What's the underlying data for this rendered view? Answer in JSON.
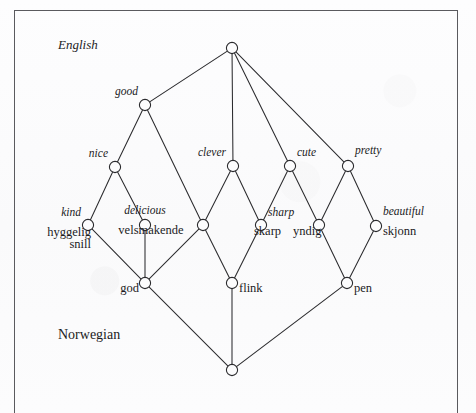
{
  "figure": {
    "type": "concept-lattice-diagram",
    "language_tags": [
      {
        "name": "english-tag",
        "text": "English",
        "style": "italic",
        "x": 58,
        "y": 48
      },
      {
        "name": "norwegian-tag",
        "text": "Norwegian",
        "style": "upright",
        "x": 58,
        "y": 338
      }
    ],
    "node_radius": 5.6,
    "stroke_color": "#2b2b2e",
    "text_color": "#1b1b1d",
    "background_color": "#fcfcfd",
    "nodes": [
      {
        "id": "top",
        "name": "node-top",
        "x": 232,
        "y": 48,
        "english": "",
        "norwegian": ""
      },
      {
        "id": "good",
        "name": "node-good",
        "x": 145,
        "y": 105,
        "english": "good",
        "norwegian": ""
      },
      {
        "id": "nice",
        "name": "node-nice",
        "x": 115,
        "y": 167,
        "english": "nice",
        "norwegian": ""
      },
      {
        "id": "clever",
        "name": "node-clever",
        "x": 233,
        "y": 166,
        "english": "clever",
        "norwegian": ""
      },
      {
        "id": "cute",
        "name": "node-cute",
        "x": 290,
        "y": 166,
        "english": "cute",
        "norwegian": ""
      },
      {
        "id": "pretty",
        "name": "node-pretty",
        "x": 348,
        "y": 166,
        "english": "pretty",
        "norwegian": ""
      },
      {
        "id": "kind",
        "name": "node-kind",
        "x": 88,
        "y": 225,
        "english": "kind",
        "norwegian": "hyggelig\nsnill"
      },
      {
        "id": "delicious",
        "name": "node-delicious",
        "x": 145,
        "y": 225,
        "english": "delicious",
        "norwegian": "velsmakende"
      },
      {
        "id": "mid-left",
        "name": "node-mid-left",
        "x": 203,
        "y": 225,
        "english": "",
        "norwegian": ""
      },
      {
        "id": "skarp",
        "name": "node-skarp",
        "x": 261,
        "y": 225,
        "english": "sharp",
        "norwegian": "skarp"
      },
      {
        "id": "yndig",
        "name": "node-yndig",
        "x": 319,
        "y": 225,
        "english": "",
        "norwegian": "yndig"
      },
      {
        "id": "skjonn",
        "name": "node-skjonn",
        "x": 376,
        "y": 226,
        "english": "beautiful",
        "norwegian": "skjonn"
      },
      {
        "id": "god",
        "name": "node-god",
        "x": 145,
        "y": 283,
        "english": "",
        "norwegian": "god"
      },
      {
        "id": "flink",
        "name": "node-flink",
        "x": 232,
        "y": 283,
        "english": "",
        "norwegian": "flink"
      },
      {
        "id": "pen",
        "name": "node-pen",
        "x": 347,
        "y": 283,
        "english": "",
        "norwegian": "pen"
      },
      {
        "id": "bottom",
        "name": "node-bottom",
        "x": 232,
        "y": 370,
        "english": "",
        "norwegian": ""
      }
    ],
    "edges": [
      {
        "name": "edge-top-good",
        "from": "top",
        "to": "good"
      },
      {
        "name": "edge-top-clever",
        "from": "top",
        "to": "clever"
      },
      {
        "name": "edge-top-cute",
        "from": "top",
        "to": "cute"
      },
      {
        "name": "edge-top-pretty",
        "from": "top",
        "to": "pretty"
      },
      {
        "name": "edge-good-nice",
        "from": "good",
        "to": "nice"
      },
      {
        "name": "edge-good-midleft",
        "from": "good",
        "to": "mid-left"
      },
      {
        "name": "edge-nice-kind",
        "from": "nice",
        "to": "kind"
      },
      {
        "name": "edge-nice-delicious",
        "from": "nice",
        "to": "delicious"
      },
      {
        "name": "edge-clever-midleft",
        "from": "clever",
        "to": "mid-left"
      },
      {
        "name": "edge-clever-skarp",
        "from": "clever",
        "to": "skarp"
      },
      {
        "name": "edge-cute-skarp",
        "from": "cute",
        "to": "skarp"
      },
      {
        "name": "edge-cute-yndig",
        "from": "cute",
        "to": "yndig"
      },
      {
        "name": "edge-pretty-yndig",
        "from": "pretty",
        "to": "yndig"
      },
      {
        "name": "edge-pretty-skjonn",
        "from": "pretty",
        "to": "skjonn"
      },
      {
        "name": "edge-kind-god",
        "from": "kind",
        "to": "god"
      },
      {
        "name": "edge-delicious-god",
        "from": "delicious",
        "to": "god"
      },
      {
        "name": "edge-midleft-god",
        "from": "mid-left",
        "to": "god"
      },
      {
        "name": "edge-midleft-flink",
        "from": "mid-left",
        "to": "flink"
      },
      {
        "name": "edge-skarp-flink",
        "from": "skarp",
        "to": "flink"
      },
      {
        "name": "edge-yndig-pen",
        "from": "yndig",
        "to": "pen"
      },
      {
        "name": "edge-skjonn-pen",
        "from": "skjonn",
        "to": "pen"
      },
      {
        "name": "edge-god-bottom",
        "from": "god",
        "to": "bottom"
      },
      {
        "name": "edge-flink-bottom",
        "from": "flink",
        "to": "bottom"
      },
      {
        "name": "edge-pen-bottom",
        "from": "pen",
        "to": "bottom"
      }
    ],
    "labels": [
      {
        "name": "label-good",
        "text": "good",
        "kind": "english",
        "x": 138,
        "y": 96,
        "anchor": "right"
      },
      {
        "name": "label-nice",
        "text": "nice",
        "kind": "english",
        "x": 108,
        "y": 158,
        "anchor": "right"
      },
      {
        "name": "label-clever",
        "text": "clever",
        "kind": "english",
        "x": 226,
        "y": 157,
        "anchor": "right"
      },
      {
        "name": "label-cute",
        "text": "cute",
        "kind": "english",
        "x": 297,
        "y": 157,
        "anchor": "left"
      },
      {
        "name": "label-pretty",
        "text": "pretty",
        "kind": "english",
        "x": 355,
        "y": 155,
        "anchor": "left"
      },
      {
        "name": "label-kind",
        "text": "kind",
        "kind": "english",
        "x": 81,
        "y": 217,
        "anchor": "right"
      },
      {
        "name": "label-delicious",
        "text": "delicious",
        "kind": "english",
        "x": 145,
        "y": 215,
        "anchor": "center"
      },
      {
        "name": "label-sharp",
        "text": "sharp",
        "kind": "english",
        "x": 268,
        "y": 217,
        "anchor": "left"
      },
      {
        "name": "label-beautiful",
        "text": "beautiful",
        "kind": "english",
        "x": 383,
        "y": 216,
        "anchor": "left"
      },
      {
        "name": "label-hyggelig",
        "text": "hyggelig",
        "kind": "norwegian",
        "x": 91,
        "y": 238,
        "anchor": "right"
      },
      {
        "name": "label-snill",
        "text": "snill",
        "kind": "norwegian",
        "x": 91,
        "y": 250,
        "anchor": "right"
      },
      {
        "name": "label-velsmakende",
        "text": "velsmakende",
        "kind": "norwegian",
        "x": 151,
        "y": 236,
        "anchor": "center"
      },
      {
        "name": "label-skarp",
        "text": "skarp",
        "kind": "norwegian",
        "x": 254,
        "y": 237,
        "anchor": "left"
      },
      {
        "name": "label-yndig",
        "text": "yndig",
        "kind": "norwegian",
        "x": 293,
        "y": 237,
        "anchor": "left"
      },
      {
        "name": "label-skjonn",
        "text": "skjonn",
        "kind": "norwegian",
        "x": 383,
        "y": 237,
        "anchor": "left"
      },
      {
        "name": "label-god",
        "text": "god",
        "kind": "norwegian",
        "x": 139,
        "y": 294,
        "anchor": "right"
      },
      {
        "name": "label-flink",
        "text": "flink",
        "kind": "norwegian",
        "x": 239,
        "y": 294,
        "anchor": "left"
      },
      {
        "name": "label-pen",
        "text": "pen",
        "kind": "norwegian",
        "x": 354,
        "y": 294,
        "anchor": "left"
      }
    ]
  }
}
